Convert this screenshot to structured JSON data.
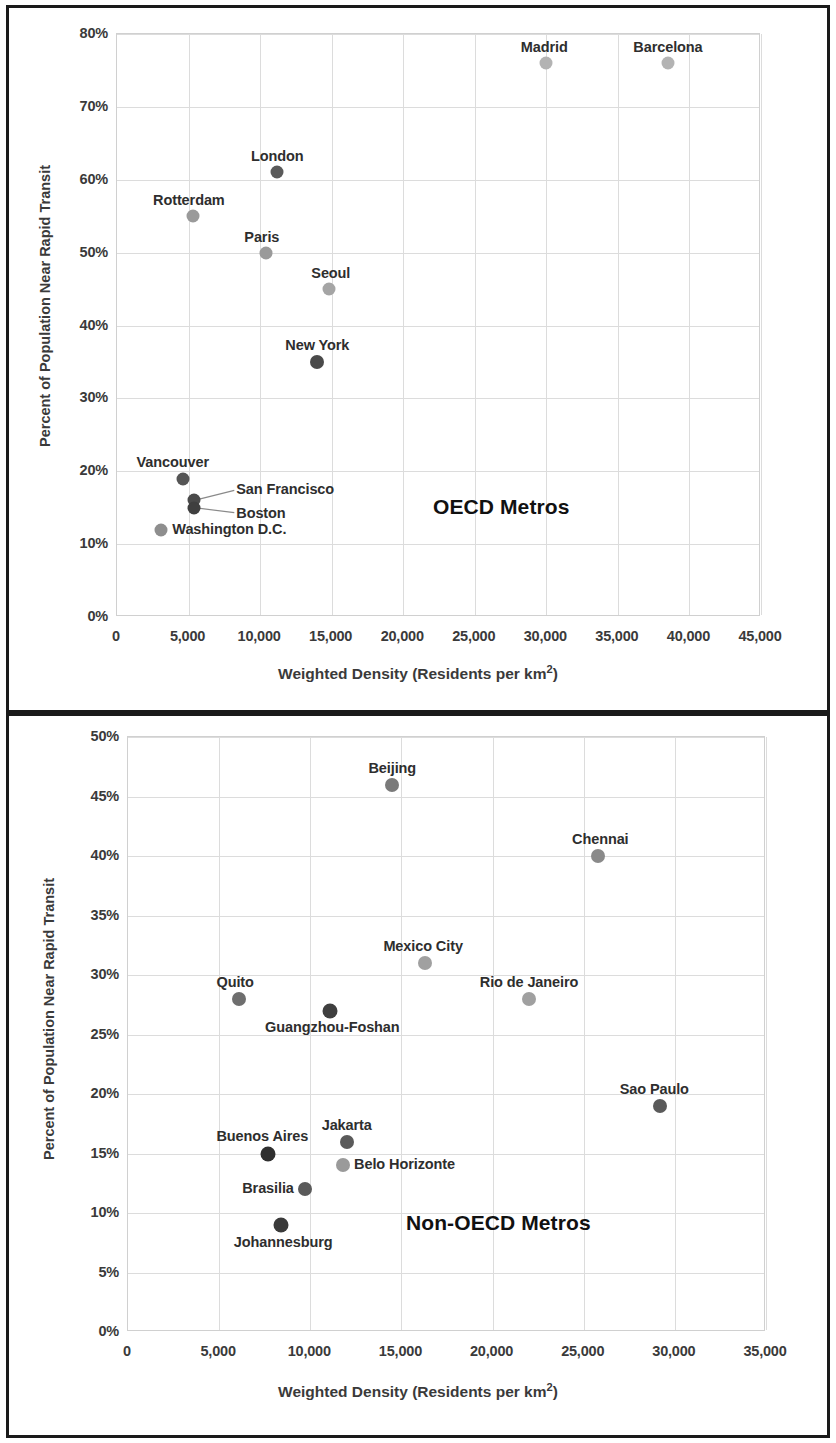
{
  "chart_data": [
    {
      "type": "scatter",
      "title": "OECD Metros",
      "xlabel": "Weighted Density (Residents per km²)",
      "ylabel": "Percent of Population Near Rapid Transit",
      "xlim": [
        0,
        45000
      ],
      "ylim": [
        0,
        0.8
      ],
      "xticks": [
        "0",
        "5,000",
        "10,000",
        "15,000",
        "20,000",
        "25,000",
        "30,000",
        "35,000",
        "40,000",
        "45,000"
      ],
      "xtickvals": [
        0,
        5000,
        10000,
        15000,
        20000,
        25000,
        30000,
        35000,
        40000,
        45000
      ],
      "yticks": [
        "0%",
        "10%",
        "20%",
        "30%",
        "40%",
        "50%",
        "60%",
        "70%",
        "80%"
      ],
      "ytickvals": [
        0,
        0.1,
        0.2,
        0.3,
        0.4,
        0.5,
        0.6,
        0.7,
        0.8
      ],
      "grid": true,
      "legend": "none",
      "points": [
        {
          "name": "Madrid",
          "x": 30000,
          "y": 0.76,
          "color": "#b3b3b3",
          "r": 6.5,
          "label_pos": "above-center",
          "ldx": -2,
          "ldy": -15
        },
        {
          "name": "Barcelona",
          "x": 38500,
          "y": 0.76,
          "color": "#b3b3b3",
          "r": 6.5,
          "label_pos": "above-center",
          "ldx": 0,
          "ldy": -15
        },
        {
          "name": "London",
          "x": 11200,
          "y": 0.61,
          "color": "#5a5a5a",
          "r": 6.5,
          "label_pos": "above-center",
          "ldx": 0,
          "ldy": -15
        },
        {
          "name": "Rotterdam",
          "x": 5300,
          "y": 0.55,
          "color": "#9a9a9a",
          "r": 6.5,
          "label_pos": "above-center",
          "ldx": -4,
          "ldy": -15
        },
        {
          "name": "Paris",
          "x": 10400,
          "y": 0.5,
          "color": "#9a9a9a",
          "r": 6.5,
          "label_pos": "above-center",
          "ldx": -4,
          "ldy": -15
        },
        {
          "name": "Seoul",
          "x": 14800,
          "y": 0.45,
          "color": "#a5a5a5",
          "r": 6.5,
          "label_pos": "above-center",
          "ldx": 2,
          "ldy": -15
        },
        {
          "name": "New York",
          "x": 14000,
          "y": 0.35,
          "color": "#4a4a4a",
          "r": 7.0,
          "label_pos": "above-center",
          "ldx": 0,
          "ldy": -16
        },
        {
          "name": "Vancouver",
          "x": 4600,
          "y": 0.19,
          "color": "#555555",
          "r": 6.5,
          "label_pos": "above-center",
          "ldx": -10,
          "ldy": -16
        },
        {
          "name": "San Francisco",
          "x": 5400,
          "y": 0.16,
          "color": "#4a4a4a",
          "r": 6.5,
          "label_pos": "leader-right",
          "ldx": 42,
          "ldy": -10
        },
        {
          "name": "Boston",
          "x": 5400,
          "y": 0.15,
          "color": "#3f3f3f",
          "r": 6.5,
          "label_pos": "leader-right",
          "ldx": 42,
          "ldy": 6
        },
        {
          "name": "Washington D.C.",
          "x": 3100,
          "y": 0.12,
          "color": "#8e8e8e",
          "r": 6.5,
          "label_pos": "right",
          "ldx": 11,
          "ldy": 0
        }
      ],
      "leaders": [
        {
          "from": "San Francisco",
          "to_dx": 40,
          "to_dy": -10
        },
        {
          "from": "Boston",
          "to_dx": 40,
          "to_dy": 5
        }
      ]
    },
    {
      "type": "scatter",
      "title": "Non-OECD Metros",
      "xlabel": "Weighted Density (Residents per km²)",
      "ylabel": "Percent of Population Near Rapid Transit",
      "xlim": [
        0,
        35000
      ],
      "ylim": [
        0,
        0.5
      ],
      "xticks": [
        "0",
        "5,000",
        "10,000",
        "15,000",
        "20,000",
        "25,000",
        "30,000",
        "35,000"
      ],
      "xtickvals": [
        0,
        5000,
        10000,
        15000,
        20000,
        25000,
        30000,
        35000
      ],
      "yticks": [
        "0%",
        "5%",
        "10%",
        "15%",
        "20%",
        "25%",
        "30%",
        "35%",
        "40%",
        "45%",
        "50%"
      ],
      "ytickvals": [
        0,
        0.05,
        0.1,
        0.15,
        0.2,
        0.25,
        0.3,
        0.35,
        0.4,
        0.45,
        0.5
      ],
      "grid": true,
      "legend": "none",
      "points": [
        {
          "name": "Beijing",
          "x": 14500,
          "y": 0.46,
          "color": "#7a7a7a",
          "r": 7.0,
          "label_pos": "above-center",
          "ldx": 0,
          "ldy": -16
        },
        {
          "name": "Chennai",
          "x": 25800,
          "y": 0.4,
          "color": "#8a8a8a",
          "r": 7.0,
          "label_pos": "above-center",
          "ldx": 2,
          "ldy": -16
        },
        {
          "name": "Mexico City",
          "x": 16300,
          "y": 0.31,
          "color": "#a0a0a0",
          "r": 7.0,
          "label_pos": "above-center",
          "ldx": -2,
          "ldy": -16
        },
        {
          "name": "Rio de Janeiro",
          "x": 22000,
          "y": 0.28,
          "color": "#a0a0a0",
          "r": 7.0,
          "label_pos": "above-center",
          "ldx": 0,
          "ldy": -16
        },
        {
          "name": "Quito",
          "x": 6100,
          "y": 0.28,
          "color": "#6e6e6e",
          "r": 7.0,
          "label_pos": "above-center",
          "ldx": -4,
          "ldy": -16
        },
        {
          "name": "Guangzhou-Foshan",
          "x": 11100,
          "y": 0.27,
          "color": "#3f3f3f",
          "r": 7.5,
          "label_pos": "below-center",
          "ldx": 2,
          "ldy": 17
        },
        {
          "name": "Sao Paulo",
          "x": 29200,
          "y": 0.19,
          "color": "#5a5a5a",
          "r": 7.0,
          "label_pos": "above-center",
          "ldx": -6,
          "ldy": -16
        },
        {
          "name": "Jakarta",
          "x": 12000,
          "y": 0.16,
          "color": "#5a5a5a",
          "r": 7.0,
          "label_pos": "above-center",
          "ldx": 0,
          "ldy": -16
        },
        {
          "name": "Buenos Aires",
          "x": 7700,
          "y": 0.15,
          "color": "#2f2f2f",
          "r": 7.5,
          "label_pos": "above-center",
          "ldx": -6,
          "ldy": -17
        },
        {
          "name": "Belo Horizonte",
          "x": 11800,
          "y": 0.14,
          "color": "#9a9a9a",
          "r": 7.0,
          "label_pos": "right",
          "ldx": 11,
          "ldy": 0
        },
        {
          "name": "Brasilia",
          "x": 9700,
          "y": 0.12,
          "color": "#5a5a5a",
          "r": 7.0,
          "label_pos": "left",
          "ldx": -11,
          "ldy": 0
        },
        {
          "name": "Johannesburg",
          "x": 8400,
          "y": 0.09,
          "color": "#3a3a3a",
          "r": 7.5,
          "label_pos": "below-center",
          "ldx": 2,
          "ldy": 18
        }
      ],
      "leaders": []
    }
  ]
}
